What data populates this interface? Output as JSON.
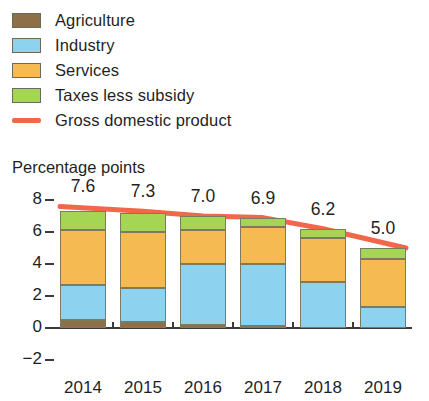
{
  "legend": {
    "items": [
      {
        "label": "Agriculture",
        "color": "#8d7048",
        "type": "swatch",
        "name": "legend-swatch-agriculture"
      },
      {
        "label": "Industry",
        "color": "#8dd3f0",
        "type": "swatch",
        "name": "legend-swatch-industry"
      },
      {
        "label": "Services",
        "color": "#f5bb52",
        "type": "swatch",
        "name": "legend-swatch-services"
      },
      {
        "label": "Taxes less subsidy",
        "color": "#9ed košnja",
        "type": "swatch",
        "name": "legend-swatch-taxes"
      },
      {
        "label": "Gross domestic product",
        "color": "#f2664a",
        "type": "line",
        "name": "legend-line-gdp"
      }
    ]
  },
  "axis_title": "Percentage points",
  "chart_data": {
    "type": "bar",
    "title": "",
    "subtitle": "",
    "xlabel": "",
    "ylabel": "Percentage points",
    "ylim": [
      -2,
      8
    ],
    "yticks": [
      8,
      6,
      4,
      2,
      0,
      -2
    ],
    "ytick_labels": [
      "8",
      "6",
      "4",
      "2",
      "0",
      "−2"
    ],
    "grid": false,
    "legend_position": "top-left",
    "stacked": true,
    "categories": [
      "2014",
      "2015",
      "2016",
      "2017",
      "2018",
      "2019"
    ],
    "series": [
      {
        "name": "Agriculture",
        "color": "#8d7048",
        "values": [
          0.5,
          0.4,
          0.2,
          0.15,
          0.0,
          0.0
        ]
      },
      {
        "name": "Industry",
        "color": "#8dd3f0",
        "values": [
          2.2,
          2.1,
          3.8,
          3.85,
          2.9,
          1.3
        ]
      },
      {
        "name": "Services",
        "color": "#f5bb52",
        "values": [
          3.4,
          3.5,
          2.1,
          2.3,
          2.7,
          3.0
        ]
      },
      {
        "name": "Taxes less subsidy",
        "color": "#a5d555",
        "values": [
          1.2,
          1.2,
          0.9,
          0.6,
          0.6,
          0.7
        ]
      }
    ],
    "line_series": {
      "name": "Gross domestic product",
      "color": "#f2664a",
      "values": [
        7.6,
        7.3,
        7.0,
        6.9,
        6.2,
        5.0
      ]
    },
    "data_labels": [
      "7.6",
      "7.3",
      "7.0",
      "6.9",
      "6.2",
      "5.0"
    ]
  }
}
